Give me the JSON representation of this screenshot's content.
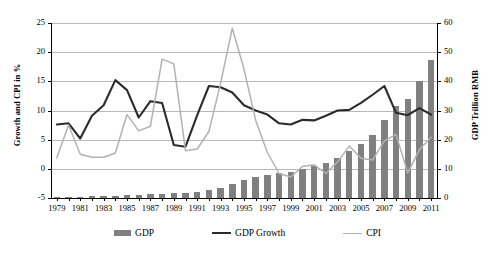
{
  "chart_data": {
    "type": "line",
    "title": "",
    "xlabel": "",
    "ylabel": "Growth and CPI in %",
    "y2label": "GDP Trillion RMB",
    "ylim": [
      -5,
      25
    ],
    "y2lim": [
      0,
      60
    ],
    "yticks": [
      -5,
      0,
      5,
      10,
      15,
      20,
      25
    ],
    "y2ticks": [
      0,
      10,
      20,
      30,
      40,
      50,
      60
    ],
    "grid": true,
    "legend_position": "bottom",
    "x": [
      1979,
      1980,
      1981,
      1982,
      1983,
      1984,
      1985,
      1986,
      1987,
      1988,
      1989,
      1990,
      1991,
      1992,
      1993,
      1994,
      1995,
      1996,
      1997,
      1998,
      1999,
      2000,
      2001,
      2002,
      2003,
      2004,
      2005,
      2006,
      2007,
      2008,
      2009,
      2010,
      2011
    ],
    "xtick_labels": [
      "1979",
      "1981",
      "1983",
      "1985",
      "1987",
      "1989",
      "1991",
      "1993",
      "1995",
      "1997",
      "1999",
      "2001",
      "2003",
      "2005",
      "2007",
      "2009",
      "2011"
    ],
    "series": [
      {
        "name": "GDP",
        "type": "bar",
        "axis": "right",
        "unit": "Trillion RMB",
        "color": "#808080",
        "values": [
          0.41,
          0.46,
          0.49,
          0.53,
          0.6,
          0.72,
          0.9,
          1.03,
          1.21,
          1.5,
          1.7,
          1.87,
          2.18,
          2.69,
          3.53,
          4.82,
          6.08,
          7.12,
          7.9,
          8.44,
          8.97,
          9.92,
          10.97,
          12.03,
          13.58,
          15.99,
          18.49,
          21.63,
          26.58,
          31.4,
          34.09,
          40.15,
          47.16
        ]
      },
      {
        "name": "GDP Growth",
        "type": "line",
        "axis": "left",
        "unit": "%",
        "color": "#2b2b2b",
        "values": [
          7.6,
          7.8,
          5.2,
          9.1,
          10.9,
          15.2,
          13.5,
          8.8,
          11.6,
          11.3,
          4.1,
          3.8,
          9.2,
          14.2,
          14.0,
          13.1,
          10.9,
          10.0,
          9.3,
          7.8,
          7.6,
          8.4,
          8.3,
          9.1,
          10.0,
          10.1,
          11.3,
          12.7,
          14.2,
          9.6,
          9.2,
          10.4,
          9.3
        ]
      },
      {
        "name": "CPI",
        "type": "line",
        "axis": "left",
        "unit": "%",
        "color": "#b2b2b2",
        "values": [
          1.9,
          7.5,
          2.5,
          2.0,
          2.0,
          2.7,
          9.3,
          6.5,
          7.3,
          18.8,
          18.0,
          3.1,
          3.4,
          6.4,
          14.7,
          24.1,
          17.1,
          8.3,
          2.8,
          -0.8,
          -1.4,
          0.4,
          0.7,
          -0.8,
          1.2,
          3.9,
          1.8,
          1.5,
          4.8,
          5.9,
          -0.7,
          3.3,
          5.4
        ]
      }
    ]
  },
  "legend": {
    "items": [
      {
        "label": "GDP",
        "marker": "bar-swatch"
      },
      {
        "label": "GDP Growth",
        "marker": "line-swatch-dark"
      },
      {
        "label": "CPI",
        "marker": "line-swatch-light"
      }
    ]
  }
}
